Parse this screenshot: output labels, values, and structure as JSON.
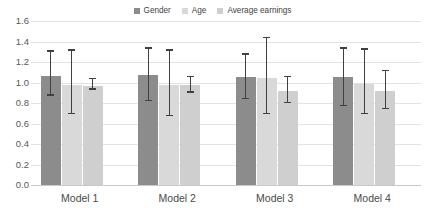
{
  "chart_data": {
    "type": "bar",
    "title": "",
    "subtitle": "",
    "xlabel": "",
    "ylabel": "",
    "categories": [
      "Model 1",
      "Model 2",
      "Model 3",
      "Model 4"
    ],
    "ylim": [
      0.0,
      1.6
    ],
    "ytick_labels": [
      "0.0",
      "0.2",
      "0.4",
      "0.6",
      "0.8",
      "1.0",
      "1.2",
      "1.4",
      "1.6"
    ],
    "ytick_values": [
      0.0,
      0.2,
      0.4,
      0.6,
      0.8,
      1.0,
      1.2,
      1.4,
      1.6
    ],
    "grid": "horizontal",
    "legend_position": "top-center",
    "error_bars": "95% confidence interval",
    "series": [
      {
        "name": "Gender",
        "color": "#8c8c8c",
        "values": [
          1.06,
          1.07,
          1.05,
          1.05
        ],
        "ci_low": [
          0.87,
          0.82,
          0.84,
          0.77
        ],
        "ci_high": [
          1.3,
          1.33,
          1.27,
          1.33
        ]
      },
      {
        "name": "Age",
        "color": "#d9d9d9",
        "values": [
          0.98,
          0.98,
          1.04,
          0.99
        ],
        "ci_low": [
          0.69,
          0.67,
          0.69,
          0.69
        ],
        "ci_high": [
          1.31,
          1.31,
          1.43,
          1.32
        ]
      },
      {
        "name": "Average earnings",
        "color": "#cfcfcf",
        "values": [
          0.97,
          0.98,
          0.92,
          0.92
        ],
        "ci_low": [
          0.93,
          0.9,
          0.8,
          0.74
        ],
        "ci_high": [
          1.03,
          1.05,
          1.05,
          1.11
        ]
      }
    ]
  },
  "legend": {
    "items": [
      {
        "label": "Gender",
        "swatch": "legend-swatch-gender"
      },
      {
        "label": "Age",
        "swatch": "legend-swatch-age"
      },
      {
        "label": "Average earnings",
        "swatch": "legend-swatch-average-earnings"
      }
    ]
  },
  "colors": {
    "gender": "#8c8c8c",
    "age": "#d9d9d9",
    "average_earnings": "#cfcfcf",
    "gridline": "#e2e2e2",
    "error_bar": "#404040",
    "axis_text": "#595959",
    "background": "#ffffff"
  }
}
